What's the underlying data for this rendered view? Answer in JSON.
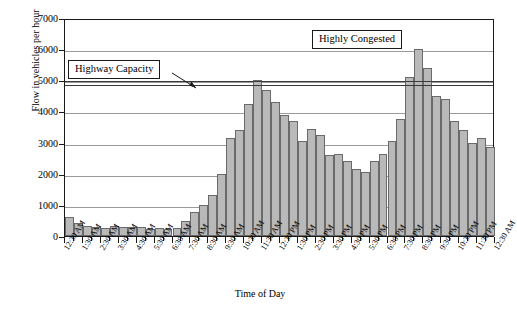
{
  "chart_data": {
    "type": "bar",
    "title": "",
    "xlabel": "Time of Day",
    "ylabel": "Flow in vehicles per hour",
    "ylim": [
      0,
      7000
    ],
    "ytick_values": [
      0,
      1000,
      2000,
      3000,
      4000,
      5000,
      6000,
      7000
    ],
    "ytick_labels": [
      "0",
      "1000",
      "2000",
      "3000",
      "4000",
      "5000",
      "6000",
      "7000"
    ],
    "grid": "horizontal",
    "legend": "none",
    "bar_fill_color": "#b9b9b9",
    "bar_edge_color": "#6a6a6a",
    "categories": [
      "12:30 AM",
      "1:30 AM",
      "2:30 AM",
      "3:30 AM",
      "4:30 AM",
      "5:30 AM",
      "6:30 AM",
      "7:30 AM",
      "8:30 AM",
      "9:30 AM",
      "10:30 AM",
      "11:30 AM",
      "12:30 PM",
      "1:30 PM",
      "2:30 PM",
      "3:30 PM",
      "4:30 PM",
      "5:30 PM",
      "6:30 PM",
      "7:30 PM",
      "8:30 PM",
      "9:30 PM",
      "10:30 PM",
      "11:30 PM",
      "12:30 AM"
    ],
    "bar_values": [
      620,
      420,
      330,
      280,
      270,
      320,
      300,
      290,
      280,
      240,
      250,
      230,
      250,
      480,
      780,
      980,
      1320,
      2000,
      3150,
      3400,
      4250,
      5000,
      4700,
      4300,
      3900,
      3700,
      3050,
      3450,
      3250,
      2600,
      2620,
      2400,
      2150,
      2060,
      2400,
      2620,
      3050,
      3750,
      5100,
      6000,
      5400,
      4500,
      4400,
      3700,
      3400,
      3000,
      3150,
      2850
    ],
    "annotations": [
      {
        "text": "Highway Capacity",
        "value": 4900,
        "type": "callout-with-arrow"
      },
      {
        "text": "Highly Congested",
        "type": "callout"
      }
    ],
    "reference_lines": [
      {
        "label": "Highway Capacity",
        "value": 4900,
        "color": "#3a3a3a"
      },
      {
        "label": "Highway Capacity upper",
        "value": 5050,
        "color": "#3a3a3a"
      }
    ]
  }
}
